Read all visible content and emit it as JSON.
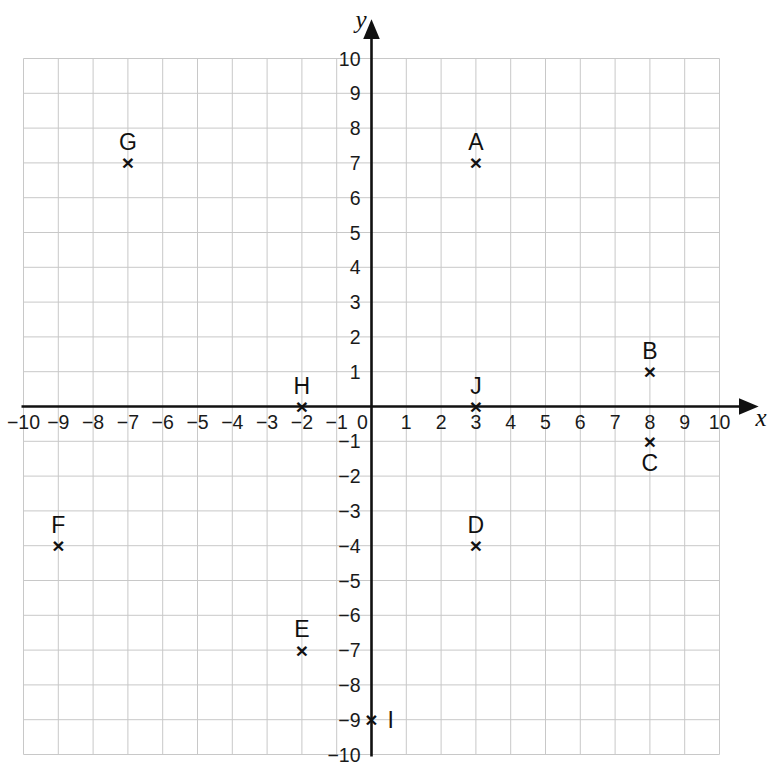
{
  "chart_data": {
    "type": "scatter",
    "title": "",
    "xlabel": "x",
    "ylabel": "y",
    "xlim": [
      -10,
      10
    ],
    "ylim": [
      -10,
      10
    ],
    "grid": true,
    "grid_step": 1,
    "legend": "none",
    "marker_style": "x",
    "x_tick_labels": [
      "-10",
      "-9",
      "-8",
      "-7",
      "-6",
      "-5",
      "-4",
      "-3",
      "-2",
      "-1",
      "0",
      "1",
      "2",
      "3",
      "4",
      "5",
      "6",
      "7",
      "8",
      "9",
      "10"
    ],
    "y_tick_labels": [
      "10",
      "9",
      "8",
      "7",
      "6",
      "5",
      "4",
      "3",
      "2",
      "1",
      "-1",
      "-2",
      "-3",
      "-4",
      "-5",
      "-6",
      "-7",
      "-8",
      "-9",
      "-10"
    ],
    "origin_label": "0",
    "points": [
      {
        "label": "A",
        "x": 3,
        "y": 7,
        "label_position": "above"
      },
      {
        "label": "B",
        "x": 8,
        "y": 1,
        "label_position": "above"
      },
      {
        "label": "C",
        "x": 8,
        "y": -1,
        "label_position": "below"
      },
      {
        "label": "D",
        "x": 3,
        "y": -4,
        "label_position": "above"
      },
      {
        "label": "E",
        "x": -2,
        "y": -7,
        "label_position": "above"
      },
      {
        "label": "F",
        "x": -9,
        "y": -4,
        "label_position": "above"
      },
      {
        "label": "G",
        "x": -7,
        "y": 7,
        "label_position": "above"
      },
      {
        "label": "H",
        "x": -2,
        "y": 0,
        "label_position": "above"
      },
      {
        "label": "I",
        "x": 0,
        "y": -9,
        "label_position": "right"
      },
      {
        "label": "J",
        "x": 3,
        "y": 0,
        "label_position": "above"
      }
    ]
  },
  "style": {
    "axis_color": "#111111",
    "grid_color": "#c8c8c8",
    "background": "#ffffff",
    "text_color": "#111111"
  }
}
